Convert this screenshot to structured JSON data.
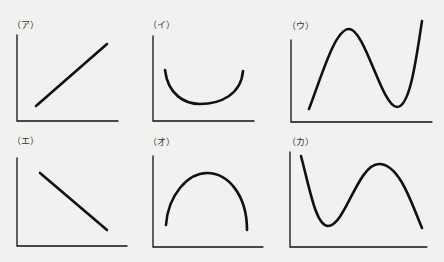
{
  "panels": [
    {
      "id": "a",
      "label": "（ア）",
      "shape": "increasing line"
    },
    {
      "id": "i",
      "label": "（イ）",
      "shape": "U-shaped curve (minimum)"
    },
    {
      "id": "u",
      "label": "（ウ）",
      "shape": "rise, peak, fall to trough, rise"
    },
    {
      "id": "e",
      "label": "（エ）",
      "shape": "decreasing line"
    },
    {
      "id": "o",
      "label": "（オ）",
      "shape": "inverted U curve (maximum)"
    },
    {
      "id": "ka",
      "label": "（カ）",
      "shape": "fall to trough, rise to peak, fall"
    }
  ],
  "colors": {
    "background": "#f1f1ef",
    "stroke": "#111111",
    "label": "#333333"
  }
}
